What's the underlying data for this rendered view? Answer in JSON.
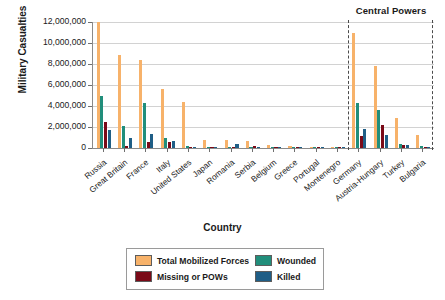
{
  "chart_data": {
    "type": "bar",
    "title": "",
    "xlabel": "Country",
    "ylabel": "Military Casualties",
    "ylim": [
      0,
      12000000
    ],
    "yticks": [
      0,
      2000000,
      4000000,
      6000000,
      8000000,
      10000000,
      12000000
    ],
    "ytick_labels": [
      "0",
      "2,000,000",
      "4,000,000",
      "6,000,000",
      "8,000,000",
      "10,000,000",
      "12,000,000"
    ],
    "grid": true,
    "legend_position": "bottom",
    "annotations": [
      {
        "text": "Central Powers",
        "x": "Germany..Bulgaria",
        "note": "bracketed region on right separated by dashed lines"
      }
    ],
    "categories": [
      "Russia",
      "Great Britain",
      "France",
      "Italy",
      "United States",
      "Japan",
      "Romania",
      "Serbia",
      "Belgium",
      "Greece",
      "Portugal",
      "Montenegro",
      "Germany",
      "Austria-Hungary",
      "Turkey",
      "Bulgaria"
    ],
    "series": [
      {
        "name": "Total Mobilized Forces",
        "color": "#F7B26A",
        "values": [
          12000000,
          8904467,
          8410000,
          5615000,
          4355000,
          800000,
          750000,
          707343,
          267000,
          230000,
          100000,
          50000,
          11000000,
          7800000,
          2850000,
          1200000
        ]
      },
      {
        "name": "Wounded",
        "color": "#218E7B",
        "values": [
          4950000,
          2090212,
          4266000,
          947000,
          204002,
          907,
          120000,
          133148,
          44686,
          21000,
          13751,
          10000,
          4247143,
          3620000,
          400000,
          152390
        ]
      },
      {
        "name": "Missing or POWs",
        "color": "#7A0A18",
        "values": [
          2500000,
          191652,
          537000,
          600000,
          4500,
          3,
          80000,
          152958,
          34659,
          1000,
          12318,
          7000,
          1152800,
          2200000,
          250000,
          27029
        ]
      },
      {
        "name": "Killed",
        "color": "#1F5E86",
        "values": [
          1700000,
          908371,
          1357800,
          650000,
          116516,
          300,
          335706,
          45000,
          13716,
          5000,
          7222,
          3000,
          1773700,
          1200000,
          325000,
          87500
        ]
      }
    ]
  },
  "axes": {
    "y_title": "Military Casualties",
    "x_title": "Country"
  },
  "annotation": {
    "central_powers": "Central Powers"
  },
  "legend": {
    "entries": [
      {
        "label": "Total Mobilized Forces",
        "color": "#F7B26A"
      },
      {
        "label": "Wounded",
        "color": "#218E7B"
      },
      {
        "label": "Missing or POWs",
        "color": "#7A0A18"
      },
      {
        "label": "Killed",
        "color": "#1F5E86"
      }
    ]
  },
  "colors": {
    "total_mobilized": "#F7B26A",
    "wounded": "#218E7B",
    "missing_pows": "#7A0A18",
    "killed": "#1F5E86",
    "grid": "#d2d2d2",
    "axis": "#8a8a8a",
    "divider": "#4a4a4a",
    "text": "#1a1a1a",
    "background": "#ffffff"
  }
}
